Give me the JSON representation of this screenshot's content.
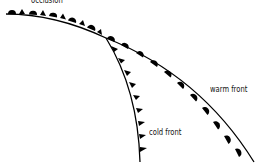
{
  "diagram": {
    "labels": {
      "occlusion": "occlusion",
      "warm_front": "warm front",
      "cold_front": "cold front"
    },
    "colors": {
      "line": "#000000",
      "background": "#ffffff"
    }
  }
}
